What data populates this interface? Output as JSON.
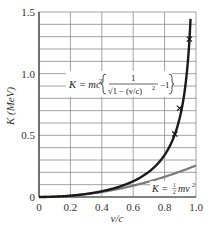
{
  "chart_data": {
    "type": "line",
    "title": "",
    "xlabel": "v/c",
    "ylabel": "K (MeV)",
    "xlim": [
      0,
      1.0
    ],
    "ylim": [
      0,
      1.5
    ],
    "xticks": [
      0,
      0.2,
      0.4,
      0.6,
      0.8,
      1.0
    ],
    "xtick_labels": [
      "0",
      "0.2",
      "0.4",
      "0.6",
      "0.8",
      "1.0"
    ],
    "yticks": [
      0,
      0.5,
      1.0,
      1.5
    ],
    "ytick_labels": [
      "0",
      "0.5",
      "1.0",
      "1.5"
    ],
    "grid": true,
    "grid_y_step": 0.1,
    "grid_x_step": 0.2,
    "rest_energy_mev": 0.511,
    "series": [
      {
        "name": "relativistic",
        "label": "K = mc²[1/√(1 − (v/c)²) − 1]",
        "color": "#1a1a1a",
        "x": [
          0,
          0.1,
          0.2,
          0.3,
          0.4,
          0.5,
          0.6,
          0.7,
          0.75,
          0.8,
          0.85,
          0.87,
          0.9,
          0.92,
          0.94,
          0.95,
          0.96
        ],
        "y": [
          0,
          0.0026,
          0.0105,
          0.0247,
          0.0465,
          0.079,
          0.128,
          0.205,
          0.262,
          0.341,
          0.459,
          0.525,
          0.661,
          0.793,
          0.987,
          1.126,
          1.314
        ]
      },
      {
        "name": "classical",
        "label": "K = ½mv²",
        "color": "#7a7a7a",
        "x": [
          0,
          0.1,
          0.2,
          0.3,
          0.4,
          0.5,
          0.6,
          0.7,
          0.8,
          0.9,
          1.0
        ],
        "y": [
          0,
          0.0026,
          0.0102,
          0.023,
          0.0409,
          0.0639,
          0.092,
          0.125,
          0.164,
          0.207,
          0.256
        ]
      },
      {
        "name": "experimental-points",
        "marker": "x",
        "color": "#1a1a1a",
        "x": [
          0.865,
          0.895,
          0.958
        ],
        "y": [
          0.51,
          0.72,
          1.28
        ]
      }
    ],
    "annotations": [
      {
        "text": "K = mc²[1/√(1 − (v/c)²) − 1]",
        "position": "center-left, y≈1.0"
      },
      {
        "text": "K = ½mv²",
        "position": "lower-right, y≈0.05"
      }
    ]
  },
  "labels": {
    "xlabel": "v/c",
    "ylabel": "K (MeV)",
    "rel_K": "K = mc",
    "rel_sup": "2",
    "rel_one": "1",
    "rel_den": "√1 − (v/c)",
    "rel_den_sup": "2",
    "rel_minus": "−1",
    "cl_K": "K = ",
    "cl_num": "1",
    "cl_den": "2",
    "cl_mv": "mv",
    "cl_sup": "2"
  }
}
